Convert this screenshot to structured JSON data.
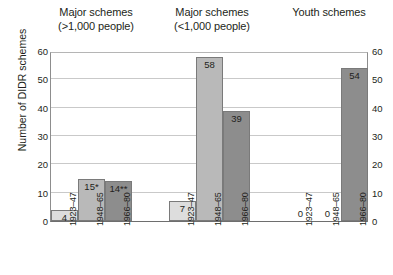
{
  "chart_data": {
    "type": "bar",
    "title": "",
    "xlabel": "",
    "ylabel": "Number of DIDR schemes",
    "ylim": [
      0,
      60
    ],
    "ytick_values": [
      0,
      10,
      20,
      30,
      40,
      50,
      60
    ],
    "grid": true,
    "legend": "none",
    "dual_axis": true,
    "categories": [
      "1923–47",
      "1948–65",
      "1966–80"
    ],
    "groups": [
      {
        "label_lines": [
          "Major schemes",
          "(>1,000 people)"
        ],
        "values": [
          4,
          15,
          14
        ],
        "value_labels": [
          "4",
          "15*",
          "14**"
        ]
      },
      {
        "label_lines": [
          "Major schemes",
          "(<1,000 people)"
        ],
        "values": [
          7,
          58,
          39
        ],
        "value_labels": [
          "7",
          "58",
          "39"
        ]
      },
      {
        "label_lines": [
          "Youth schemes"
        ],
        "values": [
          0,
          0,
          54
        ],
        "value_labels": [
          "0",
          "0",
          "54"
        ]
      }
    ],
    "series_colors": [
      "#dddddd",
      "#b9b9b9",
      "#8d8d8d"
    ]
  }
}
